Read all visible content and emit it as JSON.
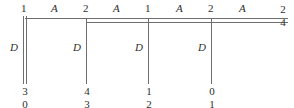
{
  "figure": {
    "kind": "structural-frame-diagram",
    "width": 294,
    "height": 108,
    "background": "#ffffff",
    "line_color": "#6e6e6e",
    "text_color": "#2e2e2e"
  },
  "top_chord": {
    "node_labels": [
      "1",
      "2",
      "1",
      "2"
    ],
    "span_labels": [
      "A",
      "A",
      "A",
      "A"
    ],
    "end_label_top": "2",
    "end_label_bottom": "4"
  },
  "verticals": [
    {
      "member_label": "D",
      "bottom_upper": "3",
      "bottom_lower": "0",
      "double_line": true
    },
    {
      "member_label": "D",
      "bottom_upper": "4",
      "bottom_lower": "3",
      "double_line": false
    },
    {
      "member_label": "D",
      "bottom_upper": "1",
      "bottom_lower": "2",
      "double_line": false
    },
    {
      "member_label": "D",
      "bottom_upper": "0",
      "bottom_lower": "1",
      "double_line": false
    }
  ]
}
